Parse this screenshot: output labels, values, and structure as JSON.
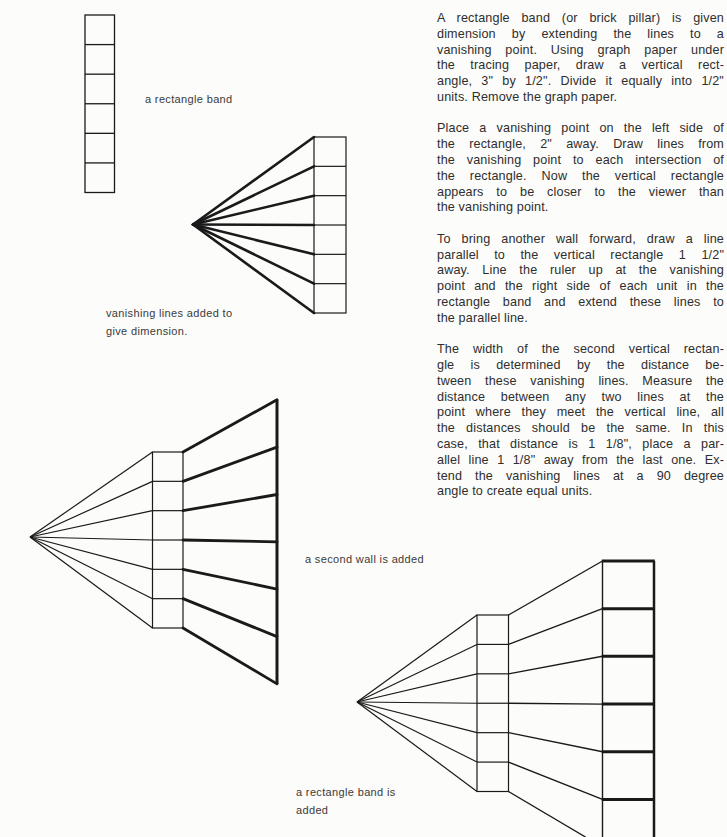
{
  "article": {
    "paragraphs": {
      "p1": {
        "lines": [
          "A rectangle band (or brick pillar) is given",
          "dimension by extending the lines to a",
          "vanishing point. Using graph paper under",
          "the tracing paper, draw a vertical rect-",
          "angle, 3\" by 1/2\". Divide it equally into 1/2\"",
          "units. Remove the graph paper."
        ]
      },
      "p2": {
        "lines": [
          "Place a vanishing point on the left side of",
          "the rectangle, 2\" away. Draw lines from",
          "the vanishing point to each intersection of",
          "the rectangle. Now the vertical rectangle",
          "appears to be closer to the viewer than",
          "the vanishing point."
        ]
      },
      "p3": {
        "lines": [
          "To bring another wall forward, draw a line",
          "parallel to the vertical rectangle 1 1/2\"",
          "away. Line the ruler up at the vanishing",
          "point and the right side of each unit in the",
          "rectangle band and extend these lines to",
          "the parallel line."
        ]
      },
      "p4": {
        "lines": [
          "The width of the second vertical rectan-",
          "gle is determined by the distance be-",
          "tween these vanishing lines. Measure the",
          "distance between any two lines at the",
          "point where they meet the vertical line, all",
          "the distances should be the same. In this",
          "case, that distance is 1 1/8\", place a par-",
          "allel line 1 1/8\" away from the last one. Ex-",
          "tend the vanishing lines at a 90 degree",
          "angle to create equal units."
        ]
      }
    }
  },
  "figures": {
    "fig1": {
      "units": 6,
      "label_lines": [
        "a rectangle band"
      ]
    },
    "fig2": {
      "units": 6,
      "label_lines": [
        "vanishing lines added to",
        "give dimension."
      ]
    },
    "fig3": {
      "units": 6,
      "label_lines": [
        "a second wall is added"
      ]
    },
    "fig4": {
      "units": 6,
      "label_lines": [
        "a rectangle band is",
        "added"
      ]
    }
  },
  "colors": {
    "line": "#1a1a1a",
    "body_text": "#2e2e2e",
    "label_text": "#3a3a3a"
  }
}
